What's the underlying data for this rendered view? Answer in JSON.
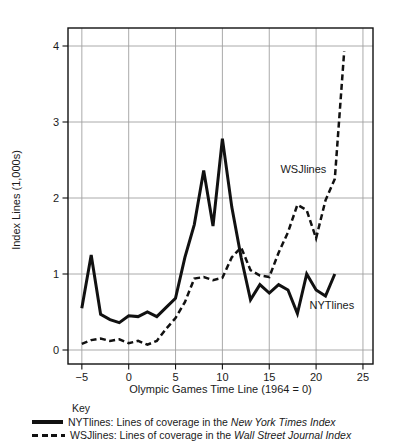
{
  "colors": {
    "ink": "#111111",
    "grid": "#a0a0a0",
    "background": "#ffffff"
  },
  "key": {
    "title": "Key",
    "entries": [
      {
        "series": "NYTlines",
        "swatch": "solid",
        "prefix": "NYTlines: Lines of coverage in the ",
        "italic": "New York Times Index"
      },
      {
        "series": "WSJlines",
        "swatch": "dashed",
        "prefix": "WSJlines: Lines of coverage in the ",
        "italic": "Wall Street Journal Index"
      }
    ]
  },
  "chart_data": {
    "type": "line",
    "title": "",
    "xlabel": "Olympic Games Time Line (1964 = 0)",
    "ylabel": "Index Lines (1,000s)",
    "xlim": [
      -6.5,
      26.0
    ],
    "ylim": [
      -0.18,
      4.24
    ],
    "x_ticks": [
      -5,
      0,
      5,
      10,
      15,
      20,
      25
    ],
    "x_tick_labels": [
      "−5",
      "0",
      "5",
      "10",
      "15",
      "20",
      "25"
    ],
    "y_ticks": [
      0,
      1,
      2,
      3,
      4
    ],
    "y_tick_labels": [
      "0",
      "1",
      "2",
      "3",
      "4"
    ],
    "grid": true,
    "legend_position": "below-chart key",
    "series": [
      {
        "name": "NYTlines",
        "style": "solid",
        "points": [
          [
            -5,
            0.55
          ],
          [
            -4,
            1.25
          ],
          [
            -3,
            0.47
          ],
          [
            -2,
            0.4
          ],
          [
            -1,
            0.36
          ],
          [
            0,
            0.45
          ],
          [
            1,
            0.44
          ],
          [
            2,
            0.5
          ],
          [
            3,
            0.44
          ],
          [
            4,
            0.56
          ],
          [
            5,
            0.68
          ],
          [
            6,
            1.22
          ],
          [
            7,
            1.65
          ],
          [
            8,
            2.36
          ],
          [
            9,
            1.63
          ],
          [
            10,
            2.78
          ],
          [
            11,
            1.88
          ],
          [
            12,
            1.22
          ],
          [
            13,
            0.66
          ],
          [
            14,
            0.86
          ],
          [
            15,
            0.75
          ],
          [
            16,
            0.86
          ],
          [
            17,
            0.79
          ],
          [
            18,
            0.48
          ],
          [
            19,
            1.0
          ],
          [
            20,
            0.79
          ],
          [
            21,
            0.71
          ],
          [
            22,
            1.0
          ]
        ]
      },
      {
        "name": "WSJlines",
        "style": "dashed",
        "points": [
          [
            -5,
            0.08
          ],
          [
            -4,
            0.13
          ],
          [
            -3,
            0.15
          ],
          [
            -2,
            0.12
          ],
          [
            -1,
            0.14
          ],
          [
            0,
            0.09
          ],
          [
            1,
            0.12
          ],
          [
            2,
            0.07
          ],
          [
            3,
            0.12
          ],
          [
            4,
            0.28
          ],
          [
            5,
            0.42
          ],
          [
            6,
            0.63
          ],
          [
            7,
            0.94
          ],
          [
            8,
            0.96
          ],
          [
            9,
            0.92
          ],
          [
            10,
            0.95
          ],
          [
            11,
            1.22
          ],
          [
            12,
            1.35
          ],
          [
            13,
            1.05
          ],
          [
            14,
            0.98
          ],
          [
            15,
            0.96
          ],
          [
            16,
            1.28
          ],
          [
            17,
            1.55
          ],
          [
            18,
            1.91
          ],
          [
            19,
            1.84
          ],
          [
            20,
            1.47
          ],
          [
            21,
            1.97
          ],
          [
            22,
            2.25
          ],
          [
            23,
            3.93
          ]
        ]
      }
    ],
    "annotations": [
      {
        "text": "WSJlines",
        "x": 16.2,
        "y": 2.46
      },
      {
        "text": "NYTlines",
        "x": 19.3,
        "y": 0.67
      }
    ]
  }
}
